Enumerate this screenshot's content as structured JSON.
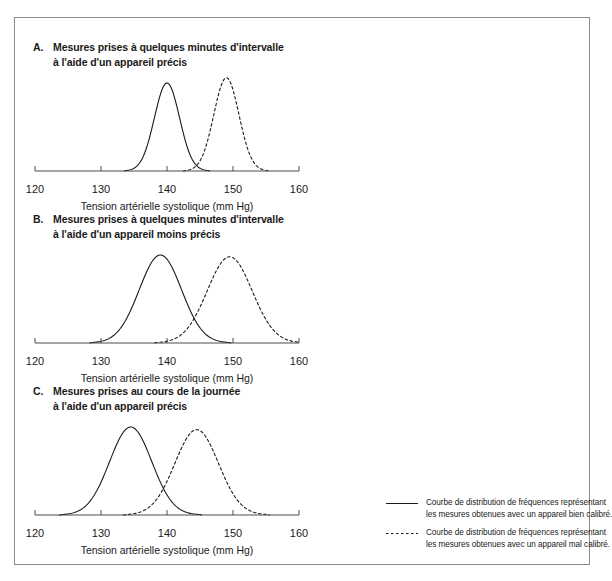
{
  "figure": {
    "panels": [
      {
        "letter": "A.",
        "title_line1": "Mesures prises à quelques minutes d'intervalle",
        "title_line2": "à l'aide d'un appareil précis",
        "axis_title": "Tension artérielle systolique (mm Hg)",
        "ticks": [
          "120",
          "130",
          "140",
          "150",
          "160"
        ]
      },
      {
        "letter": "B.",
        "title_line1": "Mesures prises à quelques minutes d'intervalle",
        "title_line2": "à l'aide d'un appareil moins précis",
        "axis_title": "Tension artérielle systolique (mm Hg)",
        "ticks": [
          "120",
          "130",
          "140",
          "150",
          "160"
        ]
      },
      {
        "letter": "C.",
        "title_line1": "Mesures prises au cours de la journée",
        "title_line2": "à l'aide d'un appareil précis",
        "axis_title": "Tension artérielle systolique (mm Hg)",
        "ticks": [
          "120",
          "130",
          "140",
          "150",
          "160"
        ]
      }
    ]
  },
  "legend": {
    "entries": [
      {
        "style": "solid",
        "line1": "Courbe de distribution de fréquences représentant",
        "line2": "les mesures obtenues avec un appareil bien calibré."
      },
      {
        "style": "dashed",
        "line1": "Courbe de distribution de fréquences représentant",
        "line2": "les mesures obtenues avec un appareil mal calibré."
      }
    ]
  },
  "colors": {
    "line": "#1a1a1a",
    "axis": "#4d4d4d",
    "frame": "#8c8c8c",
    "background": "#ffffff"
  },
  "chart_data": {
    "type": "line",
    "xlabel": "Tension artérielle systolique (mm Hg)",
    "ylabel": "",
    "xlim": [
      120,
      160
    ],
    "xticks": [
      120,
      130,
      140,
      150,
      160
    ],
    "grid": false,
    "legend_position": "bottom-right",
    "panels": [
      {
        "panel": "A",
        "label": "Mesures prises à quelques minutes d'intervalle à l'aide d'un appareil précis",
        "series": [
          {
            "name": "appareil bien calibré",
            "style": "solid",
            "distribution": "gaussian",
            "mean": 140,
            "sd": 1.9,
            "peak_height": 1.0
          },
          {
            "name": "appareil mal calibré",
            "style": "dashed",
            "distribution": "gaussian",
            "mean": 149,
            "sd": 1.9,
            "peak_height": 1.06
          }
        ]
      },
      {
        "panel": "B",
        "label": "Mesures prises à quelques minutes d'intervalle à l'aide d'un appareil moins précis",
        "series": [
          {
            "name": "appareil bien calibré",
            "style": "solid",
            "distribution": "gaussian",
            "mean": 139,
            "sd": 3.2,
            "peak_height": 1.0
          },
          {
            "name": "appareil mal calibré",
            "style": "dashed",
            "distribution": "gaussian",
            "mean": 149.5,
            "sd": 3.4,
            "peak_height": 0.98
          }
        ]
      },
      {
        "panel": "C",
        "label": "Mesures prises au cours de la journée à l'aide d'un appareil précis",
        "series": [
          {
            "name": "appareil bien calibré",
            "style": "solid",
            "distribution": "gaussian",
            "mean": 134.5,
            "sd": 3.2,
            "peak_height": 1.0
          },
          {
            "name": "appareil mal calibré",
            "style": "dashed",
            "distribution": "gaussian",
            "mean": 144.5,
            "sd": 3.3,
            "peak_height": 0.97
          }
        ]
      }
    ]
  }
}
